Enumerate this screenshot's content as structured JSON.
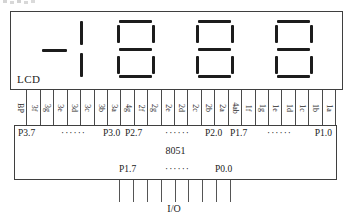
{
  "diagram": {
    "lcd": {
      "label": "LCD",
      "digits": [
        {
          "name": "digit-4-half",
          "type": "half",
          "segments": [
            "g",
            "ab"
          ]
        },
        {
          "name": "digit-3",
          "type": "full",
          "segments": [
            "a",
            "b",
            "c",
            "d",
            "e",
            "f",
            "g"
          ]
        },
        {
          "name": "digit-2",
          "type": "full",
          "segments": [
            "a",
            "b",
            "c",
            "d",
            "e",
            "f",
            "g"
          ]
        },
        {
          "name": "digit-1",
          "type": "full",
          "segments": [
            "a",
            "b",
            "c",
            "d",
            "e",
            "f",
            "g"
          ]
        }
      ]
    },
    "pins": [
      "BP",
      "3f",
      "3g",
      "3e",
      "3d",
      "3c",
      "3b",
      "3a",
      "4g",
      "2f",
      "2g",
      "2e",
      "2d",
      "2c",
      "2b",
      "2a",
      "4ab",
      "1f",
      "1g",
      "1e",
      "1d",
      "1c",
      "1b",
      "1a"
    ],
    "mcu": {
      "name": "8051",
      "top_ports": [
        "P3.7",
        "······",
        "P3.0",
        "P2.7",
        "······",
        "P2.0",
        "P1.7",
        "······",
        "P1.0"
      ],
      "bottom_ports": [
        "P1.7",
        "······",
        "P0.0"
      ],
      "io_line_count": 9,
      "io_label": "I/O"
    },
    "colors": {
      "line": "#3f3f3f",
      "segment": "#1c1c1c",
      "background": "#ffffff"
    }
  }
}
